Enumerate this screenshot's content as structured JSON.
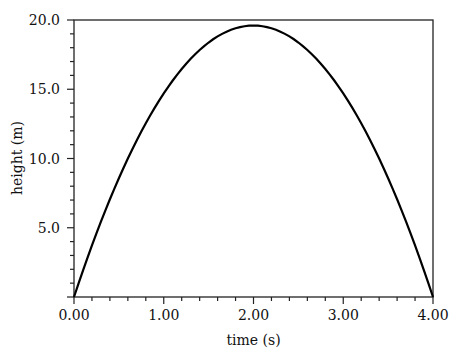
{
  "chart_data": {
    "type": "line",
    "title": "",
    "xlabel": "time (s)",
    "ylabel": "height (m)",
    "xlim": [
      0,
      4
    ],
    "ylim": [
      0,
      20
    ],
    "grid": false,
    "legend": null,
    "x_ticks": [
      "0.00",
      "1.00",
      "2.00",
      "3.00",
      "4.00"
    ],
    "y_ticks": [
      "5.0",
      "10.0",
      "15.0",
      "20.0"
    ],
    "series": [
      {
        "name": "height",
        "x": [
          0.0,
          0.25,
          0.5,
          0.75,
          1.0,
          1.25,
          1.5,
          1.75,
          2.0,
          2.25,
          2.5,
          2.75,
          3.0,
          3.25,
          3.5,
          3.75,
          4.0
        ],
        "values": [
          0.0,
          4.59,
          8.58,
          11.94,
          14.7,
          16.84,
          18.38,
          19.29,
          19.6,
          19.29,
          18.38,
          16.84,
          14.7,
          11.94,
          8.58,
          4.59,
          0.0
        ]
      }
    ]
  }
}
